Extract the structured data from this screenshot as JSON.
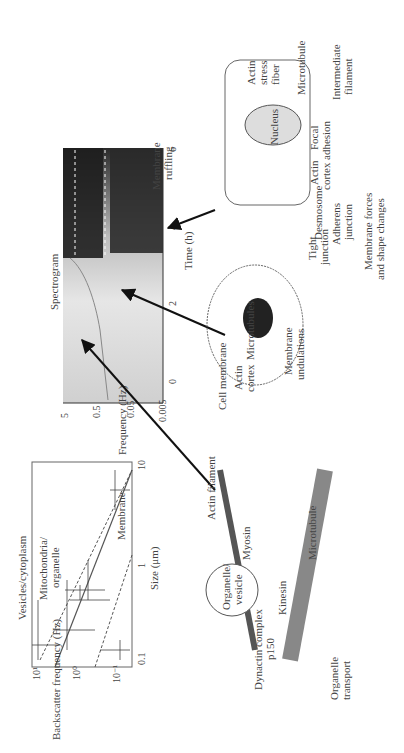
{
  "figure": {
    "orientation": "rotated-90-ccw",
    "panels": {
      "scatter": {
        "title": "Vesicles/cytoplasm",
        "ylabel": "Backscatter frequency (Hz)",
        "xlabel": "Size (μm)",
        "y_ticks": [
          "10¹",
          "10⁰",
          "10⁻¹",
          "10⁻²"
        ],
        "x_ticks": [
          "0.1",
          "1",
          "10"
        ],
        "labels": [
          "Mitochondria/",
          "organelle",
          "Membrane"
        ]
      },
      "spectrogram": {
        "title": "Spectrogram",
        "ylabel": "Frequency (Hz)",
        "xlabel": "Time (h)",
        "y_ticks": [
          "5",
          "0.5",
          "0.05",
          "0.005"
        ],
        "x_ticks": [
          "0",
          "2",
          "4",
          "6"
        ]
      },
      "transport": {
        "labels": {
          "organelle": "Organelle/",
          "vesicle": "vesicle",
          "dynactin": "Dynactin complex",
          "p150": "p150",
          "kinesin": "Kinesin",
          "myosin": "Myosin",
          "actin_filament": "Actin filament",
          "microtubule": "Microtubule",
          "caption1": "Organelle",
          "caption2": "transport"
        }
      },
      "undulation_cell": {
        "labels": {
          "cell_membrane": "Cell membrane",
          "actin": "Actin",
          "cortex": "cortex",
          "microtubules": "Microtubules",
          "lambda": "λ",
          "h": "h",
          "caption1": "Membrane",
          "caption2": "undulations"
        }
      },
      "adhesion_cell": {
        "labels": {
          "nucleus": "Nucleus",
          "mtoc": "MTOC",
          "membrane_ruffling_1": "Membrane",
          "membrane_ruffling_2": "ruffling",
          "actin_stress_1": "Actin",
          "actin_stress_2": "stress",
          "actin_stress_3": "fiber",
          "microtubule": "Microtubule",
          "intermediate_1": "Intermediate",
          "intermediate_2": "filament",
          "focal_1": "Focal",
          "focal_2": "adhesion",
          "actin_cortex_1": "Actin",
          "actin_cortex_2": "cortex",
          "tight_1": "Tight",
          "tight_2": "junction",
          "desmosome": "Desmosome",
          "adherens_1": "Adherens",
          "adherens_2": "junction",
          "forces_1": "Membrane forces",
          "forces_2": "and shape changes"
        }
      }
    }
  }
}
